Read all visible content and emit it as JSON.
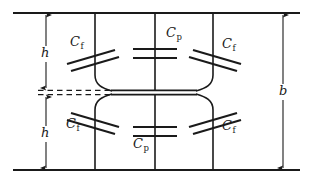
{
  "figure": {
    "type": "circuit-schematic",
    "stroke_color": "#1a1a1a",
    "background_color": "#ffffff"
  },
  "dimensions": [
    {
      "id": "h-upper",
      "label": "h",
      "x": 46,
      "y": 53
    },
    {
      "id": "h-lower",
      "label": "h",
      "x": 46,
      "y": 133
    },
    {
      "id": "b-total",
      "label": "b",
      "x": 283,
      "y": 90
    }
  ],
  "capacitors": [
    {
      "id": "cf-top-left",
      "label": "C",
      "sub": "f",
      "x": 70,
      "y": 42,
      "style": "tilted-left"
    },
    {
      "id": "cp-top",
      "label": "C",
      "sub": "p",
      "x": 166,
      "y": 33,
      "style": "horizontal"
    },
    {
      "id": "cf-top-right",
      "label": "C",
      "sub": "f",
      "x": 222,
      "y": 44,
      "style": "tilted-right"
    },
    {
      "id": "cf-bottom-left",
      "label": "C",
      "sub": "f",
      "x": 66,
      "y": 124,
      "style": "tilted-right"
    },
    {
      "id": "cp-bottom",
      "label": "C",
      "sub": "p",
      "x": 133,
      "y": 144,
      "style": "horizontal"
    },
    {
      "id": "cf-bottom-right",
      "label": "C",
      "sub": "f",
      "x": 222,
      "y": 126,
      "style": "tilted-left"
    }
  ],
  "geometry": {
    "top_plate_y": 13,
    "bottom_plate_y": 170,
    "plate_x_start": 13,
    "plate_x_end": 300,
    "center_y": 92,
    "rails_x": [
      95,
      155,
      213
    ],
    "dim_line_h_x": 46,
    "dim_line_b_x": 283
  }
}
